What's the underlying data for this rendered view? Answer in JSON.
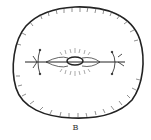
{
  "figure": {
    "label": "B",
    "stroke_color": "#222222",
    "background": "#ffffff"
  }
}
